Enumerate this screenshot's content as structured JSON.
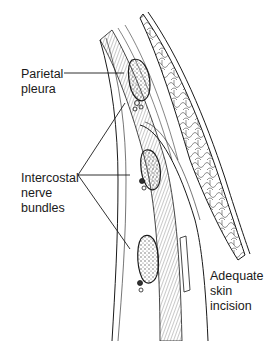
{
  "diagram": {
    "type": "anatomical-illustration",
    "labels": [
      {
        "id": "parietal-pleura",
        "text": "Parietal\npleura"
      },
      {
        "id": "intercostal-nerve-bundles",
        "text": "Intercostal\nnerve\nbundles"
      },
      {
        "id": "adequate-skin-incision",
        "text": "Adequate\nskin incision"
      }
    ],
    "colors": {
      "line": "#1a1a1a",
      "hatch": "#7a7a7a",
      "background": "#ffffff"
    }
  }
}
